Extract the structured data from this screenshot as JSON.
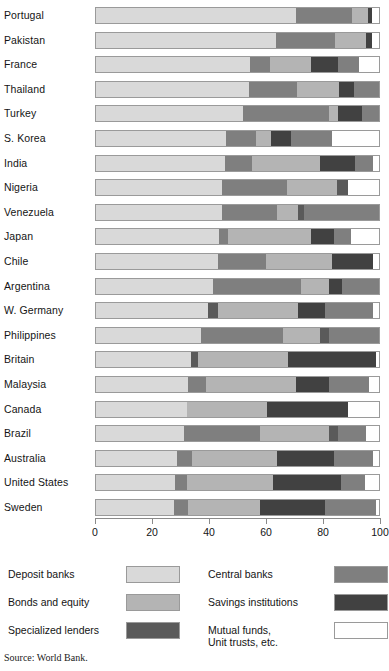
{
  "source_note": "Source: World Bank.",
  "legend": {
    "left": [
      {
        "label": "Deposit banks",
        "key": "deposit_banks",
        "color": "#d9d9d9"
      },
      {
        "label": "Bonds and equity",
        "key": "bonds_equity",
        "color": "#b4b4b4"
      },
      {
        "label": "Specialized lenders",
        "key": "specialized_lenders",
        "color": "#5a5a5a"
      }
    ],
    "right": [
      {
        "label": "Central banks",
        "key": "central_banks",
        "color": "#7f7f7f"
      },
      {
        "label": "Savings institutions",
        "key": "savings_institutions",
        "color": "#414141"
      },
      {
        "label": "Mutual funds,\nUnit trusts, etc.",
        "key": "mutual_funds",
        "color": "#ffffff"
      }
    ]
  },
  "chart_data": {
    "type": "bar",
    "orientation": "horizontal",
    "stacked": true,
    "title": "",
    "subtitle": "",
    "xlabel": "",
    "ylabel": "",
    "xlim": [
      0,
      100
    ],
    "xticks": [
      0,
      20,
      40,
      60,
      80,
      100
    ],
    "xtick_labels": [
      "0",
      "20",
      "40",
      "60",
      "80",
      "100"
    ],
    "grid": false,
    "legend_position": "bottom",
    "units": "percent of financial assets",
    "series": [
      {
        "name": "Deposit banks",
        "key": "deposit_banks",
        "color": "#d9d9d9"
      },
      {
        "name": "Central banks",
        "key": "central_banks",
        "color": "#7f7f7f"
      },
      {
        "name": "Bonds and equity",
        "key": "bonds_equity",
        "color": "#b4b4b4"
      },
      {
        "name": "Savings institutions",
        "key": "savings_institutions",
        "color": "#414141"
      },
      {
        "name": "Specialized lenders",
        "key": "specialized_lenders",
        "color": "#5a5a5a"
      },
      {
        "name": "Mutual funds, Unit trusts, etc.",
        "key": "mutual_funds",
        "color": "#ffffff"
      }
    ],
    "categories": [
      "Portugal",
      "Pakistan",
      "France",
      "Thailand",
      "Turkey",
      "S. Korea",
      "India",
      "Nigeria",
      "Venezuela",
      "Japan",
      "Chile",
      "Argentina",
      "W. Germany",
      "Philippines",
      "Britain",
      "Malaysia",
      "Canada",
      "Brazil",
      "Australia",
      "United States",
      "Sweden"
    ],
    "rows": [
      {
        "category": "Portugal",
        "segments": [
          {
            "key": "deposit_banks",
            "value": 70.5
          },
          {
            "key": "central_banks",
            "value": 20.0
          },
          {
            "key": "bonds_equity",
            "value": 5.5
          },
          {
            "key": "savings_institutions",
            "value": 1.5
          },
          {
            "key": "mutual_funds",
            "value": 2.5
          }
        ]
      },
      {
        "category": "Pakistan",
        "segments": [
          {
            "key": "deposit_banks",
            "value": 63.5
          },
          {
            "key": "central_banks",
            "value": 21.0
          },
          {
            "key": "bonds_equity",
            "value": 11.0
          },
          {
            "key": "savings_institutions",
            "value": 2.0
          },
          {
            "key": "mutual_funds",
            "value": 2.5
          }
        ]
      },
      {
        "category": "France",
        "segments": [
          {
            "key": "deposit_banks",
            "value": 54.5
          },
          {
            "key": "central_banks",
            "value": 7.0
          },
          {
            "key": "bonds_equity",
            "value": 14.5
          },
          {
            "key": "savings_institutions",
            "value": 9.5
          },
          {
            "key": "central_banks",
            "value": 7.5
          },
          {
            "key": "mutual_funds",
            "value": 7.0
          }
        ]
      },
      {
        "category": "Thailand",
        "segments": [
          {
            "key": "deposit_banks",
            "value": 54.0
          },
          {
            "key": "central_banks",
            "value": 17.0
          },
          {
            "key": "bonds_equity",
            "value": 15.0
          },
          {
            "key": "savings_institutions",
            "value": 5.0
          },
          {
            "key": "central_banks",
            "value": 9.0
          }
        ]
      },
      {
        "category": "Turkey",
        "segments": [
          {
            "key": "deposit_banks",
            "value": 52.0
          },
          {
            "key": "central_banks",
            "value": 30.5
          },
          {
            "key": "bonds_equity",
            "value": 3.0
          },
          {
            "key": "savings_institutions",
            "value": 8.5
          },
          {
            "key": "central_banks",
            "value": 6.0
          }
        ]
      },
      {
        "category": "S. Korea",
        "segments": [
          {
            "key": "deposit_banks",
            "value": 46.0
          },
          {
            "key": "central_banks",
            "value": 10.5
          },
          {
            "key": "bonds_equity",
            "value": 5.5
          },
          {
            "key": "savings_institutions",
            "value": 7.0
          },
          {
            "key": "central_banks",
            "value": 14.5
          },
          {
            "key": "mutual_funds",
            "value": 16.5
          }
        ]
      },
      {
        "category": "India",
        "segments": [
          {
            "key": "deposit_banks",
            "value": 45.5
          },
          {
            "key": "central_banks",
            "value": 9.5
          },
          {
            "key": "bonds_equity",
            "value": 24.0
          },
          {
            "key": "savings_institutions",
            "value": 12.5
          },
          {
            "key": "central_banks",
            "value": 6.5
          },
          {
            "key": "mutual_funds",
            "value": 2.0
          }
        ]
      },
      {
        "category": "Nigeria",
        "segments": [
          {
            "key": "deposit_banks",
            "value": 44.5
          },
          {
            "key": "central_banks",
            "value": 23.0
          },
          {
            "key": "bonds_equity",
            "value": 17.5
          },
          {
            "key": "specialized_lenders",
            "value": 4.0
          },
          {
            "key": "mutual_funds",
            "value": 11.0
          }
        ]
      },
      {
        "category": "Venezuela",
        "segments": [
          {
            "key": "deposit_banks",
            "value": 44.5
          },
          {
            "key": "central_banks",
            "value": 19.5
          },
          {
            "key": "bonds_equity",
            "value": 7.5
          },
          {
            "key": "specialized_lenders",
            "value": 2.0
          },
          {
            "key": "central_banks",
            "value": 26.5
          }
        ]
      },
      {
        "category": "Japan",
        "segments": [
          {
            "key": "deposit_banks",
            "value": 43.5
          },
          {
            "key": "central_banks",
            "value": 3.0
          },
          {
            "key": "bonds_equity",
            "value": 29.5
          },
          {
            "key": "savings_institutions",
            "value": 8.0
          },
          {
            "key": "central_banks",
            "value": 6.0
          },
          {
            "key": "mutual_funds",
            "value": 10.0
          }
        ]
      },
      {
        "category": "Chile",
        "segments": [
          {
            "key": "deposit_banks",
            "value": 43.0
          },
          {
            "key": "central_banks",
            "value": 17.0
          },
          {
            "key": "bonds_equity",
            "value": 23.5
          },
          {
            "key": "savings_institutions",
            "value": 14.5
          },
          {
            "key": "mutual_funds",
            "value": 2.0
          }
        ]
      },
      {
        "category": "Argentina",
        "segments": [
          {
            "key": "deposit_banks",
            "value": 41.5
          },
          {
            "key": "central_banks",
            "value": 31.0
          },
          {
            "key": "bonds_equity",
            "value": 10.0
          },
          {
            "key": "savings_institutions",
            "value": 4.5
          },
          {
            "key": "central_banks",
            "value": 13.0
          }
        ]
      },
      {
        "category": "W. Germany",
        "segments": [
          {
            "key": "deposit_banks",
            "value": 39.5
          },
          {
            "key": "specialized_lenders",
            "value": 3.5
          },
          {
            "key": "bonds_equity",
            "value": 28.5
          },
          {
            "key": "savings_institutions",
            "value": 9.5
          },
          {
            "key": "central_banks",
            "value": 17.0
          },
          {
            "key": "mutual_funds",
            "value": 2.0
          }
        ]
      },
      {
        "category": "Philippines",
        "segments": [
          {
            "key": "deposit_banks",
            "value": 37.0
          },
          {
            "key": "central_banks",
            "value": 29.0
          },
          {
            "key": "bonds_equity",
            "value": 13.0
          },
          {
            "key": "specialized_lenders",
            "value": 3.5
          },
          {
            "key": "central_banks",
            "value": 17.5
          }
        ]
      },
      {
        "category": "Britain",
        "segments": [
          {
            "key": "deposit_banks",
            "value": 33.5
          },
          {
            "key": "specialized_lenders",
            "value": 2.5
          },
          {
            "key": "bonds_equity",
            "value": 32.0
          },
          {
            "key": "savings_institutions",
            "value": 31.0
          },
          {
            "key": "mutual_funds",
            "value": 1.0
          }
        ]
      },
      {
        "category": "Malaysia",
        "segments": [
          {
            "key": "deposit_banks",
            "value": 32.5
          },
          {
            "key": "central_banks",
            "value": 6.5
          },
          {
            "key": "bonds_equity",
            "value": 31.5
          },
          {
            "key": "savings_institutions",
            "value": 12.0
          },
          {
            "key": "central_banks",
            "value": 14.0
          },
          {
            "key": "mutual_funds",
            "value": 3.5
          }
        ]
      },
      {
        "category": "Canada",
        "segments": [
          {
            "key": "deposit_banks",
            "value": 32.0
          },
          {
            "key": "bonds_equity",
            "value": 28.5
          },
          {
            "key": "savings_institutions",
            "value": 28.5
          },
          {
            "key": "mutual_funds",
            "value": 11.0
          }
        ]
      },
      {
        "category": "Brazil",
        "segments": [
          {
            "key": "deposit_banks",
            "value": 31.0
          },
          {
            "key": "central_banks",
            "value": 27.0
          },
          {
            "key": "bonds_equity",
            "value": 24.5
          },
          {
            "key": "specialized_lenders",
            "value": 3.0
          },
          {
            "key": "central_banks",
            "value": 10.0
          },
          {
            "key": "mutual_funds",
            "value": 4.5
          }
        ]
      },
      {
        "category": "Australia",
        "segments": [
          {
            "key": "deposit_banks",
            "value": 28.5
          },
          {
            "key": "central_banks",
            "value": 5.5
          },
          {
            "key": "bonds_equity",
            "value": 30.0
          },
          {
            "key": "savings_institutions",
            "value": 20.0
          },
          {
            "key": "central_banks",
            "value": 14.0
          },
          {
            "key": "mutual_funds",
            "value": 2.0
          }
        ]
      },
      {
        "category": "United States",
        "segments": [
          {
            "key": "deposit_banks",
            "value": 28.0
          },
          {
            "key": "central_banks",
            "value": 4.0
          },
          {
            "key": "bonds_equity",
            "value": 30.5
          },
          {
            "key": "savings_institutions",
            "value": 24.0
          },
          {
            "key": "central_banks",
            "value": 8.5
          },
          {
            "key": "mutual_funds",
            "value": 5.0
          }
        ]
      },
      {
        "category": "Sweden",
        "segments": [
          {
            "key": "deposit_banks",
            "value": 27.5
          },
          {
            "key": "central_banks",
            "value": 5.0
          },
          {
            "key": "bonds_equity",
            "value": 25.5
          },
          {
            "key": "savings_institutions",
            "value": 23.0
          },
          {
            "key": "central_banks",
            "value": 18.0
          },
          {
            "key": "mutual_funds",
            "value": 1.0
          }
        ]
      }
    ]
  }
}
